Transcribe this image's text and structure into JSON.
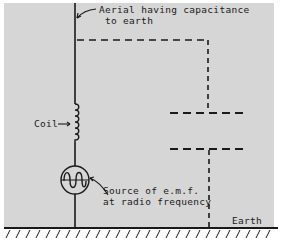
{
  "diagram": {
    "labels": {
      "aerial_line1": "Aerial having capacitance",
      "aerial_line2": "to earth",
      "coil": "Coil",
      "source_line1": "Source of e.m.f.",
      "source_line2": "at radio frequency",
      "earth": "Earth"
    },
    "components": [
      {
        "id": "aerial",
        "type": "wire",
        "label": "Aerial having capacitance to earth"
      },
      {
        "id": "coil",
        "type": "inductor",
        "label": "Coil"
      },
      {
        "id": "source",
        "type": "ac-source",
        "label": "Source of e.m.f. at radio frequency"
      },
      {
        "id": "capacitor",
        "type": "capacitor-dashed",
        "label": "capacitance to earth"
      },
      {
        "id": "earth",
        "type": "ground",
        "label": "Earth"
      }
    ],
    "colors": {
      "background": "#d6d6d6",
      "ink": "#1a1a1a",
      "page": "#ffffff"
    }
  }
}
